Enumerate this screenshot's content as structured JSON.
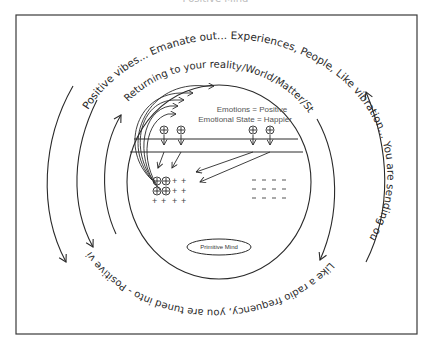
{
  "caption": {
    "text": "Positive Mind"
  },
  "curved_text": {
    "outer_top": "Positive vibes... Emanate out... Experiences, People, Like vibration... You are sending out.",
    "inner_top": "Returning to your reality/World/Matter/Stuff",
    "bottom": "Like a radio frequency, you are tuned into - Positive vibrations"
  },
  "mind": {
    "emotions_label": "Emotions = Positive",
    "state_label": "Emotional State = Happier",
    "primitive_mind_label": "Primitive Mind",
    "plus_symbol": "+",
    "minus_symbol": "–",
    "charge_symbol": "⊕"
  },
  "colors": {
    "stroke": "#2a2a2a",
    "border": "#3a3a3a",
    "background": "#ffffff"
  }
}
